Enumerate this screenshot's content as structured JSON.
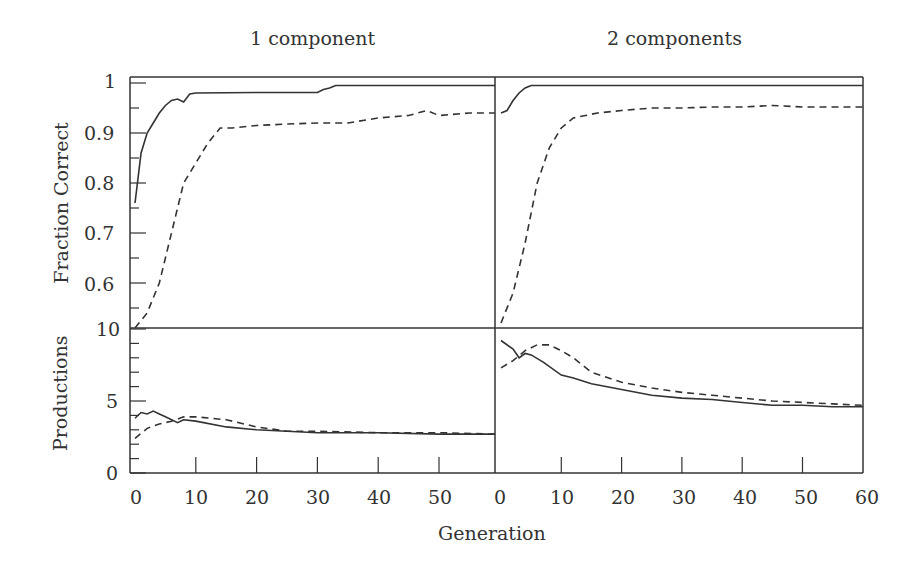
{
  "figure": {
    "panel_titles": [
      "1 component",
      "2 components"
    ],
    "ylabel_top": "Fraction Correct",
    "ylabel_bottom": "Productions",
    "xlabel": "Generation",
    "y_ticks_top": [
      "1",
      "0.9",
      "0.8",
      "0.7",
      "0.6"
    ],
    "y_ticks_bottom": [
      "10",
      "5",
      "0"
    ],
    "x_ticks_left": [
      "0",
      "10",
      "20",
      "30",
      "40",
      "50"
    ],
    "x_ticks_right": [
      "0",
      "10",
      "20",
      "30",
      "40",
      "50",
      "60"
    ]
  },
  "chart_data": [
    {
      "type": "line",
      "title": "1 component",
      "panel": "top-left",
      "xlabel": "Generation",
      "ylabel": "Fraction Correct",
      "xlim": [
        0,
        60
      ],
      "ylim": [
        0.51,
        1.01
      ],
      "series": [
        {
          "name": "solid",
          "style": "solid",
          "x": [
            0,
            1,
            2,
            3,
            4,
            5,
            6,
            7,
            8,
            9,
            10,
            20,
            30,
            31,
            32,
            33,
            40,
            50,
            60
          ],
          "values": [
            0.76,
            0.86,
            0.9,
            0.92,
            0.94,
            0.955,
            0.965,
            0.968,
            0.962,
            0.978,
            0.98,
            0.981,
            0.981,
            0.987,
            0.99,
            0.995,
            0.995,
            0.995,
            0.995
          ]
        },
        {
          "name": "dashed",
          "style": "dashed",
          "x": [
            0,
            2,
            4,
            6,
            8,
            10,
            12,
            14,
            16,
            20,
            25,
            30,
            35,
            40,
            45,
            48,
            50,
            55,
            60
          ],
          "values": [
            0.51,
            0.54,
            0.6,
            0.7,
            0.8,
            0.84,
            0.88,
            0.91,
            0.91,
            0.915,
            0.918,
            0.92,
            0.92,
            0.93,
            0.935,
            0.945,
            0.935,
            0.94,
            0.94
          ]
        }
      ]
    },
    {
      "type": "line",
      "title": "2 components",
      "panel": "top-right",
      "xlabel": "Generation",
      "ylabel": "Fraction Correct",
      "xlim": [
        0,
        60
      ],
      "ylim": [
        0.51,
        1.01
      ],
      "series": [
        {
          "name": "solid",
          "style": "solid",
          "x": [
            0,
            1,
            2,
            3,
            4,
            5,
            10,
            20,
            30,
            40,
            50,
            60
          ],
          "values": [
            0.94,
            0.945,
            0.965,
            0.98,
            0.99,
            0.995,
            0.995,
            0.995,
            0.995,
            0.995,
            0.995,
            0.995
          ]
        },
        {
          "name": "dashed",
          "style": "dashed",
          "x": [
            0,
            2,
            4,
            6,
            8,
            10,
            12,
            14,
            16,
            20,
            25,
            30,
            35,
            40,
            45,
            50,
            55,
            60
          ],
          "values": [
            0.52,
            0.58,
            0.68,
            0.8,
            0.87,
            0.91,
            0.93,
            0.935,
            0.94,
            0.945,
            0.95,
            0.95,
            0.952,
            0.952,
            0.955,
            0.952,
            0.952,
            0.952
          ]
        }
      ]
    },
    {
      "type": "line",
      "title": "1 component",
      "panel": "bottom-left",
      "xlabel": "Generation",
      "ylabel": "Productions",
      "xlim": [
        0,
        60
      ],
      "ylim": [
        0,
        10
      ],
      "series": [
        {
          "name": "solid",
          "style": "solid",
          "x": [
            0,
            1,
            2,
            3,
            4,
            5,
            7,
            8,
            10,
            15,
            20,
            25,
            30,
            40,
            50,
            60
          ],
          "values": [
            3.8,
            4.2,
            4.1,
            4.3,
            4.1,
            3.9,
            3.5,
            3.7,
            3.6,
            3.2,
            3.0,
            2.9,
            2.8,
            2.8,
            2.7,
            2.7
          ]
        },
        {
          "name": "dashed",
          "style": "dashed",
          "x": [
            0,
            2,
            4,
            6,
            8,
            10,
            15,
            20,
            25,
            30,
            40,
            50,
            60
          ],
          "values": [
            2.4,
            3.1,
            3.4,
            3.6,
            3.9,
            3.9,
            3.7,
            3.2,
            2.9,
            2.9,
            2.8,
            2.8,
            2.7
          ]
        }
      ]
    },
    {
      "type": "line",
      "title": "2 components",
      "panel": "bottom-right",
      "xlabel": "Generation",
      "ylabel": "Productions",
      "xlim": [
        0,
        60
      ],
      "ylim": [
        0,
        10
      ],
      "series": [
        {
          "name": "solid",
          "style": "solid",
          "x": [
            0,
            2,
            3,
            4,
            5,
            7,
            10,
            12,
            15,
            20,
            25,
            30,
            35,
            40,
            45,
            50,
            55,
            60
          ],
          "values": [
            9.2,
            8.6,
            8.0,
            8.3,
            8.2,
            7.7,
            6.8,
            6.6,
            6.2,
            5.8,
            5.4,
            5.2,
            5.1,
            4.9,
            4.7,
            4.7,
            4.6,
            4.6
          ]
        },
        {
          "name": "dashed",
          "style": "dashed",
          "x": [
            0,
            2,
            4,
            6,
            8,
            10,
            12,
            15,
            20,
            25,
            30,
            35,
            40,
            45,
            50,
            55,
            60
          ],
          "values": [
            7.3,
            7.8,
            8.5,
            8.9,
            8.9,
            8.5,
            8.0,
            7.0,
            6.3,
            5.9,
            5.6,
            5.4,
            5.2,
            5.0,
            4.9,
            4.8,
            4.7
          ]
        }
      ]
    }
  ]
}
